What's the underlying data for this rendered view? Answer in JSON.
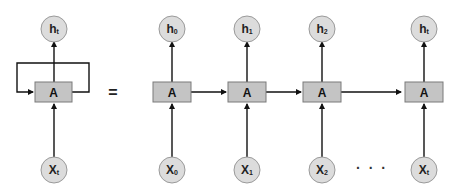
{
  "diagram": {
    "folded": {
      "output": {
        "main": "h",
        "sub": "t"
      },
      "cell": "A",
      "input": {
        "main": "X",
        "sub": "t"
      }
    },
    "equals": "=",
    "unrolled": [
      {
        "output": {
          "main": "h",
          "sub": "0"
        },
        "cell": "A",
        "input": {
          "main": "X",
          "sub": "0"
        }
      },
      {
        "output": {
          "main": "h",
          "sub": "1"
        },
        "cell": "A",
        "input": {
          "main": "X",
          "sub": "1"
        }
      },
      {
        "output": {
          "main": "h",
          "sub": "2"
        },
        "cell": "A",
        "input": {
          "main": "X",
          "sub": "2"
        }
      },
      {
        "output": {
          "main": "h",
          "sub": "t"
        },
        "cell": "A",
        "input": {
          "main": "X",
          "sub": "t"
        }
      }
    ],
    "ellipsis": "· · ·",
    "colors": {
      "node_fill": "#dcdcdc",
      "cell_fill": "#c4c4c4",
      "line": "#111111"
    }
  }
}
